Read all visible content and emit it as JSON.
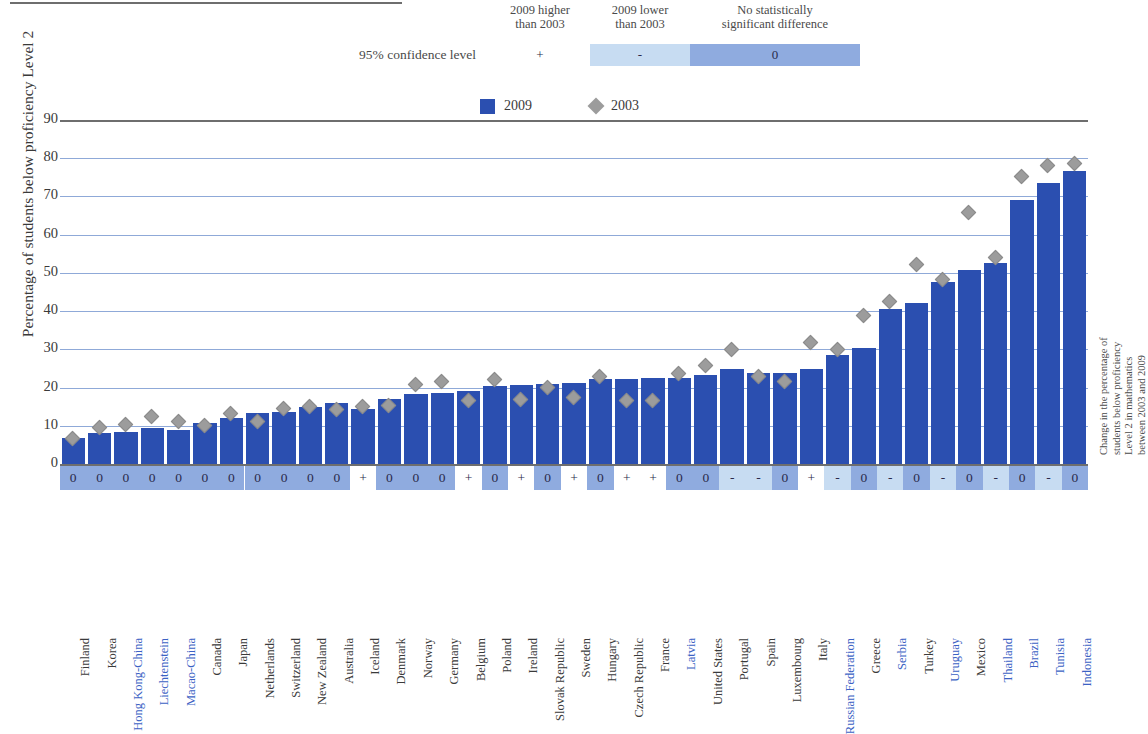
{
  "legend": {
    "confidence_label": "95% confidence level",
    "headers": [
      "2009 higher\nthan 2003",
      "2009 lower\nthan 2003",
      "No statistically\nsignificant difference"
    ],
    "header_plus_line1": "2009 higher",
    "header_plus_line2": "than 2003",
    "header_minus_line1": "2009 lower",
    "header_minus_line2": "than 2003",
    "header_zero_line1": "No statistically",
    "header_zero_line2": "significant difference",
    "symbol_plus": "+",
    "symbol_minus": "-",
    "symbol_zero": "0",
    "series": [
      {
        "name": "2009",
        "marker": "bar-swatch",
        "color": "#2b4fb0"
      },
      {
        "name": "2003",
        "marker": "diamond-swatch",
        "color": "#9c9c9c"
      }
    ]
  },
  "axes": {
    "y_title": "Percentage of students below proficiency Level 2",
    "right_title_line1": "Change in the percentage of",
    "right_title_line2": "students below proficiency",
    "right_title_line3": "Level 2 in mathematics",
    "right_title_line4": "between 2003 and 2009",
    "y_ticks": [
      0,
      10,
      20,
      30,
      40,
      50,
      60,
      70,
      80,
      90
    ]
  },
  "chart_data": {
    "type": "bar",
    "title": "Percentage of students below proficiency Level 2 in mathematics",
    "xlabel": "",
    "ylabel": "Percentage of students below proficiency Level 2",
    "ylim": [
      0,
      90
    ],
    "grid": true,
    "legend_position": "top-center",
    "categories": [
      "Finland",
      "Korea",
      "Hong Kong-China",
      "Liechtenstein",
      "Macao-China",
      "Canada",
      "Japan",
      "Netherlands",
      "Switzerland",
      "New Zealand",
      "Australia",
      "Iceland",
      "Denmark",
      "Norway",
      "Germany",
      "Belgium",
      "Poland",
      "Ireland",
      "Slovak Republic",
      "Sweden",
      "Hungary",
      "Czech Republic",
      "France",
      "Latvia",
      "United States",
      "Portugal",
      "Spain",
      "Luxembourg",
      "Italy",
      "Russian Federation",
      "Greece",
      "Serbia",
      "Turkey",
      "Uruguay",
      "Mexico",
      "Thailand",
      "Brazil",
      "Tunisia",
      "Indonesia"
    ],
    "partner_economies": [
      "Hong Kong-China",
      "Liechtenstein",
      "Macao-China",
      "Latvia",
      "Russian Federation",
      "Serbia",
      "Uruguay",
      "Thailand",
      "Brazil",
      "Tunisia",
      "Indonesia"
    ],
    "series": [
      {
        "name": "2009",
        "color": "#2b4fb0",
        "values": [
          6.8,
          8.1,
          8.5,
          9.5,
          9.0,
          10.8,
          12.1,
          13.4,
          13.5,
          15.0,
          15.9,
          14.3,
          17.1,
          18.2,
          18.6,
          19.0,
          20.5,
          20.8,
          21.0,
          21.1,
          22.3,
          22.3,
          22.5,
          22.6,
          23.4,
          24.9,
          23.7,
          23.9,
          24.9,
          28.6,
          30.3,
          40.6,
          42.1,
          47.6,
          50.8,
          52.5,
          69.1,
          73.4,
          76.6
        ]
      },
      {
        "name": "2003",
        "color": "#9c9c9c",
        "values": [
          6.8,
          9.5,
          10.4,
          12.4,
          11.0,
          10.1,
          13.3,
          11.0,
          14.5,
          15.0,
          14.3,
          15.0,
          15.4,
          20.8,
          21.6,
          16.5,
          22.0,
          16.8,
          19.9,
          17.3,
          23.0,
          16.6,
          16.6,
          23.7,
          25.7,
          30.0,
          23.0,
          21.7,
          31.9,
          30.0,
          38.9,
          42.6,
          52.2,
          48.2,
          65.9,
          54.0,
          75.2,
          78.0,
          78.5
        ]
      }
    ],
    "significance": [
      "0",
      "0",
      "0",
      "0",
      "0",
      "0",
      "0",
      "0",
      "0",
      "0",
      "0",
      "+",
      "0",
      "0",
      "0",
      "+",
      "0",
      "+",
      "0",
      "+",
      "0",
      "+",
      "+",
      "0",
      "0",
      "-",
      "-",
      "0",
      "+",
      "-",
      "0",
      "-",
      "0",
      "-",
      "0",
      "-",
      "0",
      "-",
      "0"
    ]
  }
}
